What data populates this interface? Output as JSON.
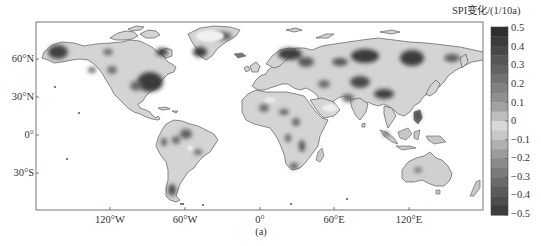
{
  "figure": {
    "panel_label": "(a)",
    "colorbar": {
      "title": "SPI变化/(1/10a)",
      "ticks": [
        "0.5",
        "0.4",
        "0.3",
        "0.2",
        "0.1",
        "0",
        "−0.1",
        "−0.2",
        "−0.3",
        "−0.4",
        "−0.5"
      ],
      "range": [
        -0.5,
        0.5
      ],
      "step": 0.05,
      "colors_top_to_bottom": [
        "#2e2e2e",
        "#3b3b3b",
        "#484848",
        "#565656",
        "#646464",
        "#727272",
        "#818181",
        "#909090",
        "#a2a2a2",
        "#bdbdbd",
        "#d8d8d8",
        "#c8c8c8",
        "#b0b0b0",
        "#9b9b9b",
        "#8a8a8a",
        "#7a7a7a",
        "#6a6a6a",
        "#5b5b5b",
        "#4c4c4c",
        "#3d3d3d"
      ]
    },
    "axes": {
      "lat_ticks": [
        "60°N",
        "30°N",
        "0°",
        "30°S"
      ],
      "lon_ticks": [
        "120°W",
        "60°W",
        "0°",
        "60°E",
        "120°E"
      ]
    },
    "colors": {
      "land_base": "#d4d4d4",
      "coast": "#5a5a5a",
      "ocean": "#ffffff",
      "frame": "#555555"
    }
  },
  "chart_data": {
    "type": "heatmap",
    "title": "",
    "xlabel": "Longitude",
    "ylabel": "Latitude",
    "x_ticks": [
      "120°W",
      "60°W",
      "0°",
      "60°E",
      "120°E"
    ],
    "y_ticks": [
      "60°N",
      "30°N",
      "0°",
      "30°S"
    ],
    "xlim": [
      -180,
      180
    ],
    "ylim": [
      -60,
      90
    ],
    "colorbar": {
      "label": "SPI变化/(1/10a)",
      "min": -0.5,
      "max": 0.5,
      "ticks": [
        0.5,
        0.4,
        0.3,
        0.2,
        0.1,
        0,
        -0.1,
        -0.2,
        -0.3,
        -0.4,
        -0.5
      ]
    },
    "notable_regions": [
      {
        "region": "Alaska",
        "magnitude": "high"
      },
      {
        "region": "Eastern United States",
        "magnitude": "high"
      },
      {
        "region": "Southern Greenland",
        "magnitude": "high"
      },
      {
        "region": "Scandinavia / NW Russia",
        "magnitude": "high"
      },
      {
        "region": "Central Siberia",
        "magnitude": "high"
      },
      {
        "region": "Eastern Siberia",
        "magnitude": "moderate-high"
      },
      {
        "region": "Central Asia / Kazakhstan",
        "magnitude": "moderate-high"
      },
      {
        "region": "Northern China",
        "magnitude": "moderate-high"
      },
      {
        "region": "Sahel / Central Africa",
        "magnitude": "moderate"
      },
      {
        "region": "Amazon Basin",
        "magnitude": "moderate"
      },
      {
        "region": "Southern Chile / Patagonia",
        "magnitude": "moderate-high"
      },
      {
        "region": "Maritime Southeast Asia / Philippines",
        "magnitude": "moderate-high"
      },
      {
        "region": "Australia interior",
        "magnitude": "low-moderate"
      }
    ],
    "panel_label": "(a)"
  }
}
